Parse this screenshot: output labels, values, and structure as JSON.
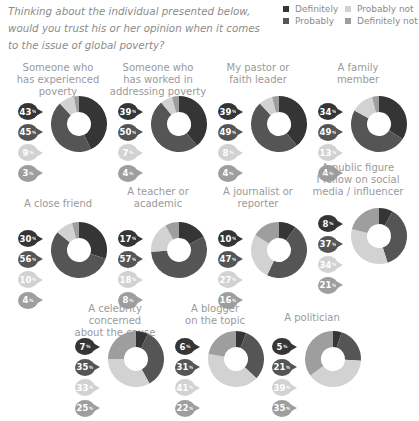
{
  "question": "Thinking about the individual presented below, would you trust his or her opinion when it comes to the issue of global poverty?",
  "legend": [
    {
      "label": "Definitely",
      "color": "#353535"
    },
    {
      "label": "Probably not",
      "color": "#d2d2d2"
    },
    {
      "label": "Probably",
      "color": "#555555"
    },
    {
      "label": "Definitely not",
      "color": "#9e9e9e"
    }
  ],
  "chart_data": {
    "type": "pie",
    "variant": "donut",
    "title": "Thinking about the individual presented below, would you trust his or her opinion when it comes to the issue of global poverty?",
    "series_order": [
      "Definitely",
      "Probably",
      "Probably not",
      "Definitely not"
    ],
    "colors": {
      "Definitely": "#353535",
      "Probably": "#555555",
      "Probably not": "#d2d2d2",
      "Definitely not": "#9e9e9e"
    },
    "unit": "%",
    "legend_position": "top-right",
    "charts": [
      {
        "label": "Someone who has experienced poverty",
        "values": [
          43,
          45,
          9,
          3
        ]
      },
      {
        "label": "Someone who has worked in addressing poverty",
        "values": [
          39,
          50,
          7,
          4
        ]
      },
      {
        "label": "My pastor or faith leader",
        "values": [
          39,
          49,
          8,
          4
        ]
      },
      {
        "label": "A family member",
        "values": [
          34,
          49,
          13,
          4
        ]
      },
      {
        "label": "A close friend",
        "values": [
          30,
          56,
          10,
          4
        ]
      },
      {
        "label": "A teacher or academic",
        "values": [
          17,
          57,
          18,
          8
        ]
      },
      {
        "label": "A journalist or reporter",
        "values": [
          10,
          47,
          27,
          16
        ]
      },
      {
        "label": "A public figure I follow on social media / influencer",
        "values": [
          8,
          37,
          34,
          21
        ]
      },
      {
        "label": "A celebrity concerned about the cause",
        "values": [
          7,
          35,
          33,
          25
        ]
      },
      {
        "label": "A blogger on the topic",
        "values": [
          6,
          31,
          41,
          22
        ]
      },
      {
        "label": "A politician",
        "values": [
          5,
          21,
          39,
          35
        ]
      }
    ]
  },
  "panels": [
    {
      "title_lines": [
        "Someone who",
        "has experienced",
        "poverty"
      ],
      "values": [
        "43",
        "45",
        "9",
        "3"
      ]
    },
    {
      "title_lines": [
        "Someone who",
        "has worked in",
        "addressing poverty"
      ],
      "values": [
        "39",
        "50",
        "7",
        "4"
      ]
    },
    {
      "title_lines": [
        "My pastor or",
        "faith leader"
      ],
      "values": [
        "39",
        "49",
        "8",
        "4"
      ]
    },
    {
      "title_lines": [
        "A family",
        "member"
      ],
      "values": [
        "34",
        "49",
        "13",
        "4"
      ]
    },
    {
      "title_lines": [
        "A close friend"
      ],
      "values": [
        "30",
        "56",
        "10",
        "4"
      ]
    },
    {
      "title_lines": [
        "A teacher or",
        "academic"
      ],
      "values": [
        "17",
        "57",
        "18",
        "8"
      ]
    },
    {
      "title_lines": [
        "A journalist or",
        "reporter"
      ],
      "values": [
        "10",
        "47",
        "27",
        "16"
      ]
    },
    {
      "title_lines": [
        "A public figure",
        "I follow on social",
        "media / influencer"
      ],
      "values": [
        "8",
        "37",
        "34",
        "21"
      ]
    },
    {
      "title_lines": [
        "A celebrity concerned",
        "about the cause"
      ],
      "values": [
        "7",
        "35",
        "33",
        "25"
      ]
    },
    {
      "title_lines": [
        "A blogger",
        "on the topic"
      ],
      "values": [
        "6",
        "31",
        "41",
        "22"
      ]
    },
    {
      "title_lines": [
        "A politician"
      ],
      "values": [
        "5",
        "21",
        "39",
        "35"
      ]
    }
  ],
  "percent_sign": "%"
}
